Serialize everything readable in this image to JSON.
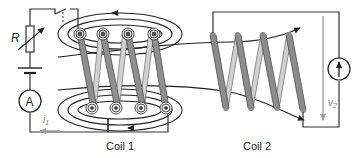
{
  "labels": {
    "resistor": "R",
    "ammeter": "A",
    "current": "i",
    "current_sub": "1",
    "voltage": "v",
    "voltage_sub": "2",
    "coil1": "Coil 1",
    "coil2": "Coil 2"
  },
  "colors": {
    "wire": "#333333",
    "coil_dark": "#8c8c8c",
    "coil_light": "#d0d0d0",
    "arrow_gray": "#a0a0a0",
    "background": "#ffffff"
  },
  "coil1": {
    "turns": 4
  },
  "coil2": {
    "turns": 4
  }
}
